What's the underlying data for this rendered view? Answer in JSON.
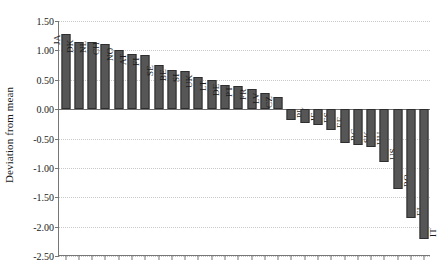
{
  "chart_data": {
    "type": "bar",
    "title": "",
    "xlabel": "",
    "ylabel": "Deviation from mean",
    "ylim": [
      -2.5,
      1.5
    ],
    "ytick_labels": [
      "1.50",
      "1.00",
      "0.50",
      "0.00",
      "-0.50",
      "-1.00",
      "-1.50",
      "-2.00",
      "-2.50"
    ],
    "ytick_values": [
      1.5,
      1.0,
      0.5,
      0.0,
      -0.5,
      -1.0,
      -1.5,
      -2.0,
      -2.5
    ],
    "grid": true,
    "legend": "none",
    "bar_color": "#565656",
    "categories": [
      "JA",
      "DK",
      "NL",
      "CH",
      "NO",
      "AT",
      "FI",
      "SE",
      "BE",
      "SI",
      "UK",
      "LT",
      "DE",
      "PT",
      "FR",
      "LV",
      "CZ",
      "PL",
      "IE",
      "ES",
      "EE",
      "BG",
      "SK",
      "HU",
      "US",
      "RO",
      "EL",
      "IT"
    ],
    "values": [
      1.28,
      1.15,
      1.15,
      1.11,
      1.0,
      0.94,
      0.92,
      0.75,
      0.66,
      0.65,
      0.55,
      0.49,
      0.41,
      0.4,
      0.34,
      0.27,
      0.2,
      -0.18,
      -0.24,
      -0.27,
      -0.35,
      -0.58,
      -0.61,
      -0.65,
      -0.9,
      -1.36,
      -1.85,
      -2.21
    ]
  }
}
